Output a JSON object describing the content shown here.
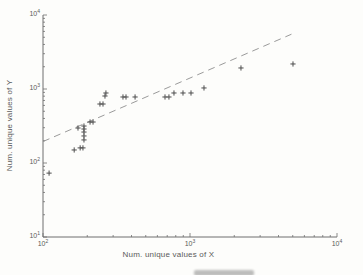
{
  "figure": {
    "background": "#fdfdfb",
    "axis_color": "#6e6e6e",
    "text_color": "#5a5a5a",
    "marker_color": "#4d4d4d",
    "trend_line_color": "#8f8f8f",
    "tick_base": "10"
  },
  "chart_data": {
    "type": "scatter",
    "title": "",
    "xlabel": "Num. unique values of X",
    "ylabel": "Num. unique values of Y",
    "x_scale": "log",
    "y_scale": "log",
    "xlim": [
      100,
      10000
    ],
    "ylim": [
      10,
      10000
    ],
    "x_tick_exponents": [
      2,
      3,
      4
    ],
    "y_tick_exponents": [
      1,
      2,
      3,
      4
    ],
    "grid": false,
    "legend": "none",
    "marker": "+",
    "points": [
      [
        110,
        73
      ],
      [
        163,
        150
      ],
      [
        179,
        160
      ],
      [
        187,
        160
      ],
      [
        173,
        297
      ],
      [
        190,
        316
      ],
      [
        190,
        288
      ],
      [
        190,
        262
      ],
      [
        190,
        232
      ],
      [
        190,
        205
      ],
      [
        209,
        358
      ],
      [
        219,
        358
      ],
      [
        244,
        627
      ],
      [
        256,
        627
      ],
      [
        264,
        804
      ],
      [
        268,
        883
      ],
      [
        350,
        780
      ],
      [
        367,
        780
      ],
      [
        423,
        780
      ],
      [
        676,
        780
      ],
      [
        719,
        780
      ],
      [
        778,
        883
      ],
      [
        896,
        883
      ],
      [
        1016,
        883
      ],
      [
        1245,
        1033
      ],
      [
        2222,
        1924
      ],
      [
        5019,
        2178
      ]
    ],
    "trend_line": {
      "style": "dashed",
      "x": [
        100,
        4900
      ],
      "y": [
        195,
        5500
      ]
    }
  }
}
